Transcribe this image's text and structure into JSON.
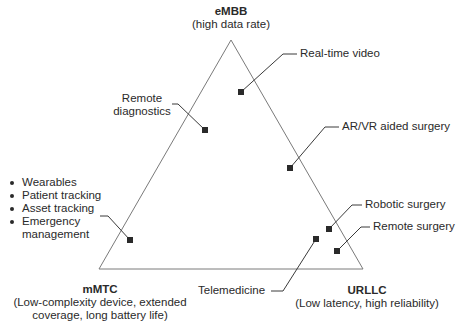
{
  "colors": {
    "triangle_stroke": "#7a7a7a",
    "leader_stroke": "#3a3a3a",
    "marker_fill": "#2a2a2a",
    "text": "#2a2a2a"
  },
  "corners": {
    "embb": {
      "title": "eMBB",
      "subtitle": "(high data rate)"
    },
    "mmtc": {
      "title": "mMTC",
      "subtitle": "(Low-complexity device, extended\ncoverage, long battery life)"
    },
    "urllc": {
      "title": "URLLC",
      "subtitle": "(Low latency, high reliability)"
    }
  },
  "applications": {
    "real_time_video": "Real-time video",
    "remote_diagnostics_line1": "Remote",
    "remote_diagnostics_line2": "diagnostics",
    "ar_vr_surgery": "AR/VR aided surgery",
    "robotic_surgery": "Robotic surgery",
    "remote_surgery": "Remote surgery",
    "telemedicine": "Telemedicine"
  },
  "mmtc_list": {
    "items": [
      "Wearables",
      "Patient tracking",
      "Asset tracking",
      "Emergency",
      "management"
    ]
  }
}
